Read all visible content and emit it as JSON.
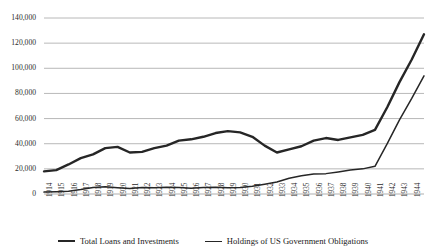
{
  "chart_data": {
    "type": "line",
    "title": "",
    "xlabel": "",
    "ylabel": "",
    "grid": true,
    "legend_position": "bottom",
    "ylim": [
      0,
      140000
    ],
    "ytick_labels": [
      "140,000",
      "120,000",
      "100,000",
      "80,000",
      "60,000",
      "40,000",
      "20,000",
      "0"
    ],
    "yticks": [
      140000,
      120000,
      100000,
      80000,
      60000,
      40000,
      20000,
      0
    ],
    "x": [
      1914,
      1915,
      1916,
      1917,
      1918,
      1919,
      1920,
      1921,
      1922,
      1923,
      1924,
      1925,
      1926,
      1927,
      1928,
      1929,
      1930,
      1931,
      1932,
      1933,
      1934,
      1935,
      1936,
      1937,
      1938,
      1939,
      1940,
      1941,
      1942,
      1943,
      1944,
      1945
    ],
    "xtick_labels": [
      "1914",
      "1915",
      "1916",
      "1917",
      "1918",
      "1919",
      "1920",
      "1921",
      "1922",
      "1923",
      "1924",
      "1925",
      "1926",
      "1927",
      "1928",
      "1929",
      "1930",
      "1931",
      "1932",
      "1933",
      "1934",
      "1935",
      "1936",
      "1937",
      "1938",
      "1939",
      "1940",
      "1941",
      "1942",
      "1943",
      "1944",
      "1945"
    ],
    "series": [
      {
        "name": "Total Loans and Investments",
        "color": "#262626",
        "width": 2.4,
        "values": [
          18000,
          19000,
          23500,
          28500,
          31500,
          36500,
          37500,
          33000,
          33500,
          36500,
          38500,
          42500,
          43500,
          45500,
          48500,
          50000,
          49000,
          45500,
          38500,
          33000,
          35500,
          38000,
          42500,
          44500,
          43000,
          45000,
          47000,
          51000,
          69000,
          89000,
          107000,
          127000
        ]
      },
      {
        "name": "Holdings of US Government Obligations",
        "color": "#262626",
        "width": 1.5,
        "values": [
          1500,
          1800,
          2200,
          3500,
          5200,
          5800,
          5000,
          4400,
          5200,
          5000,
          5400,
          5200,
          4600,
          5200,
          5400,
          5000,
          5200,
          6200,
          7800,
          9500,
          12500,
          14500,
          16000,
          16200,
          17500,
          19000,
          20000,
          22000,
          40000,
          59000,
          76000,
          94000
        ]
      }
    ]
  },
  "legend": {
    "items": [
      {
        "label": "Total Loans and Investments"
      },
      {
        "label": "Holdings of US Government Obligations"
      }
    ]
  }
}
